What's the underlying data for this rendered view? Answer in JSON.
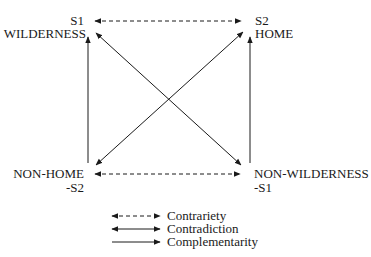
{
  "diagram": {
    "type": "semiotic-square",
    "nodes": {
      "top_left": {
        "code": "S1",
        "term": "WILDERNESS"
      },
      "top_right": {
        "code": "S2",
        "term": "HOME"
      },
      "bottom_left": {
        "term": "NON-HOME",
        "code": "-S2"
      },
      "bottom_right": {
        "term": "NON-WILDERNESS",
        "code": "-S1"
      }
    },
    "relations": [
      {
        "from": "S1",
        "to": "S2",
        "kind": "Contrariety"
      },
      {
        "from": "NON-HOME",
        "to": "NON-WILDERNESS",
        "kind": "Contrariety"
      },
      {
        "from": "S1",
        "to": "NON-WILDERNESS",
        "kind": "Contradiction"
      },
      {
        "from": "S2",
        "to": "NON-HOME",
        "kind": "Contradiction"
      },
      {
        "from": "NON-HOME",
        "to": "S1",
        "kind": "Complementarity"
      },
      {
        "from": "NON-WILDERNESS",
        "to": "S2",
        "kind": "Complementarity"
      }
    ],
    "legend": {
      "contrariety": "Contrariety",
      "contradiction": "Contradiction",
      "complementarity": "Complementarity"
    },
    "colors": {
      "line": "#1a1a1a",
      "background": "#ffffff"
    }
  }
}
